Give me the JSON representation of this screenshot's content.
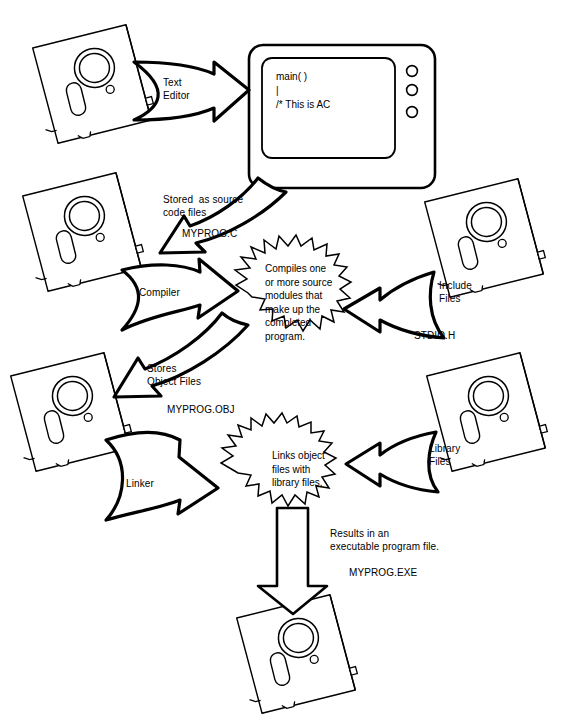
{
  "diagram": {
    "colors": {
      "ink": "#000000",
      "paper": "#ffffff"
    }
  },
  "monitor": {
    "name": "computer-monitor",
    "screen_lines": [
      "main( )",
      "|",
      "/* This is AC"
    ],
    "button_count": 3
  },
  "disks": [
    {
      "id": "disk-text-editor",
      "label": ""
    },
    {
      "id": "disk-source",
      "label": ""
    },
    {
      "id": "disk-include",
      "label": ""
    },
    {
      "id": "disk-object",
      "label": ""
    },
    {
      "id": "disk-library",
      "label": ""
    },
    {
      "id": "disk-executable",
      "label": ""
    }
  ],
  "arrows": [
    {
      "id": "arrow-text-editor",
      "label": "Text\nEditor"
    },
    {
      "id": "arrow-stored-source",
      "label": "Stored  as source\ncode files"
    },
    {
      "id": "arrow-compiler",
      "label": "Compiler"
    },
    {
      "id": "arrow-include",
      "label": "Include\nFiles"
    },
    {
      "id": "arrow-stores-object",
      "label": "Stores\nObject Files"
    },
    {
      "id": "arrow-linker",
      "label": "Linker"
    },
    {
      "id": "arrow-library",
      "label": "Library\nFiles"
    },
    {
      "id": "arrow-result",
      "label": ""
    }
  ],
  "bursts": [
    {
      "id": "burst-compiler",
      "text": "Compiles one\nor more source\nmodules that\nmake up the\ncompleted\nprogram."
    },
    {
      "id": "burst-linker",
      "text": "Links object\nfiles with\nlibrary files."
    }
  ],
  "filenames": {
    "source": "MYPROG.C",
    "object": "MYPROG.OBJ",
    "include": "STDIO.H",
    "executable": "MYPROG.EXE"
  },
  "notes": {
    "result": "Results in an\nexecutable program file."
  }
}
